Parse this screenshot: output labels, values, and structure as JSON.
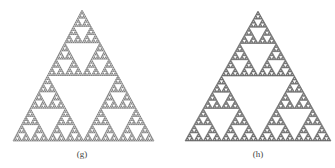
{
  "figure": {
    "panels": [
      {
        "label": "(g)",
        "depth": 6,
        "apex": [
          82,
          10
        ],
        "base_left": [
          13,
          141
        ],
        "base_right": [
          154,
          141
        ],
        "caption_pos": [
          67,
          149
        ]
      },
      {
        "label": "(h)",
        "depth": 7,
        "apex": [
          258,
          11
        ],
        "base_left": [
          185,
          141
        ],
        "base_right": [
          331,
          141
        ],
        "caption_pos": [
          243,
          149
        ]
      }
    ],
    "colors": {
      "ink": "#3a3a3a",
      "background": "#ffffff"
    }
  }
}
